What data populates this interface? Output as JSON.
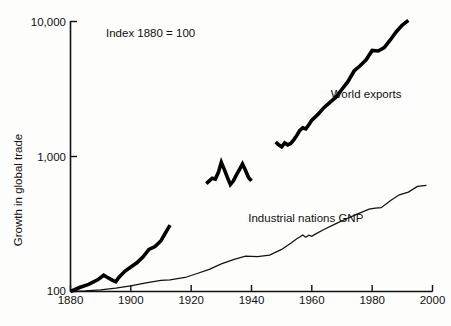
{
  "chart_data": {
    "type": "line",
    "title": "",
    "annotation": "Index 1880 = 100",
    "xlabel": "",
    "ylabel": "Growth in global trade",
    "yscale": "log",
    "ylim": [
      100,
      10000
    ],
    "xlim": [
      1880,
      2000
    ],
    "grid": false,
    "legend_position": "inline-labels",
    "y_ticks": [
      {
        "value": 10000,
        "label": "10,000"
      },
      {
        "value": 1000,
        "label": "1,000"
      },
      {
        "value": 100,
        "label": "100"
      }
    ],
    "x_ticks": [
      {
        "value": 1880,
        "label": "1880"
      },
      {
        "value": 1900,
        "label": "1900"
      },
      {
        "value": 1920,
        "label": "1920"
      },
      {
        "value": 1940,
        "label": "1940"
      },
      {
        "value": 1960,
        "label": "1960"
      },
      {
        "value": 1980,
        "label": "1980"
      },
      {
        "value": 2000,
        "label": "2000"
      }
    ],
    "series": [
      {
        "name": "World exports",
        "label": "World exports",
        "style": "thick",
        "label_x": 1978,
        "label_y": 2700,
        "segments": [
          {
            "name": "1880-1913",
            "x": [
              1880,
              1883,
              1886,
              1889,
              1891,
              1892,
              1894,
              1895,
              1896,
              1898,
              1900,
              1902,
              1904,
              1906,
              1908,
              1910,
              1912,
              1913
            ],
            "y": [
              100,
              107,
              113,
              122,
              132,
              128,
              121,
              118,
              127,
              141,
              152,
              163,
              180,
              205,
              215,
              238,
              285,
              310
            ]
          },
          {
            "name": "1925-1940",
            "x": [
              1925,
              1926,
              1927,
              1928,
              1929,
              1930,
              1931,
              1932,
              1933,
              1934,
              1935,
              1936,
              1937,
              1938,
              1939,
              1940
            ],
            "y": [
              630,
              660,
              690,
              680,
              760,
              905,
              800,
              700,
              620,
              660,
              730,
              800,
              880,
              790,
              700,
              660
            ]
          },
          {
            "name": "1948-1992",
            "x": [
              1948,
              1949,
              1950,
              1951,
              1952,
              1953,
              1954,
              1955,
              1956,
              1957,
              1958,
              1959,
              1960,
              1962,
              1964,
              1966,
              1968,
              1970,
              1972,
              1974,
              1976,
              1978,
              1980,
              1982,
              1984,
              1986,
              1988,
              1990,
              1992
            ],
            "y": [
              1280,
              1220,
              1180,
              1260,
              1220,
              1250,
              1330,
              1430,
              1560,
              1630,
              1600,
              1720,
              1860,
              2050,
              2300,
              2520,
              2750,
              3150,
              3600,
              4300,
              4700,
              5200,
              6100,
              6050,
              6400,
              7300,
              8400,
              9400,
              10200
            ]
          }
        ]
      },
      {
        "name": "Industrial nations GNP",
        "label": "Industrial nations GNP",
        "style": "thin",
        "label_x": 1958,
        "label_y": 330,
        "segments": [
          {
            "name": "1880-1998",
            "x": [
              1880,
              1885,
              1890,
              1895,
              1900,
              1905,
              1910,
              1913,
              1918,
              1922,
              1926,
              1930,
              1934,
              1938,
              1942,
              1946,
              1950,
              1953,
              1955,
              1956,
              1957,
              1958,
              1959,
              1960,
              1961,
              1964,
              1968,
              1972,
              1976,
              1979,
              1981,
              1983,
              1986,
              1989,
              1992,
              1995,
              1998
            ],
            "y": [
              100,
              101,
              103,
              106,
              110,
              116,
              121,
              122,
              127,
              136,
              146,
              160,
              172,
              183,
              181,
              186,
              205,
              228,
              246,
              253,
              262,
              252,
              261,
              256,
              265,
              288,
              318,
              350,
              382,
              408,
              415,
              418,
              470,
              520,
              545,
              600,
              612
            ]
          }
        ]
      }
    ]
  },
  "figure": {
    "background": "#fdfdfb",
    "line_color": "#000000",
    "axis_color": "#111111"
  }
}
